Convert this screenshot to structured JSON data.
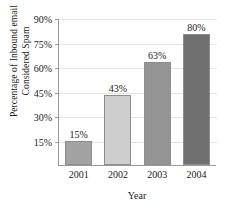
{
  "chart_data": {
    "type": "bar",
    "title": "",
    "xlabel": "Year",
    "ylabel": "Percentage of Inbound email Considered Spam",
    "ylabel_lines": [
      "Percentage of Inbound email",
      "Considered Spam"
    ],
    "categories": [
      "2001",
      "2002",
      "2003",
      "2004"
    ],
    "values": [
      15,
      43,
      63,
      80
    ],
    "value_labels": [
      "15%",
      "43%",
      "63%",
      "80%"
    ],
    "ylim": [
      0,
      90
    ],
    "yticks": [
      15,
      30,
      45,
      60,
      75,
      90
    ],
    "ytick_labels": [
      "15%",
      "30%",
      "45%",
      "60%",
      "75%",
      "90%"
    ],
    "grid": true,
    "grid_axis": "y",
    "legend": false,
    "bar_colors": [
      "#a3a3a3",
      "#cfcfcf",
      "#949494",
      "#6f6f6f"
    ],
    "grid_color": "#e3e3e3",
    "axis_color": "#9a9a9a",
    "text_color": "#1a1a1a",
    "background": "#ffffff"
  }
}
